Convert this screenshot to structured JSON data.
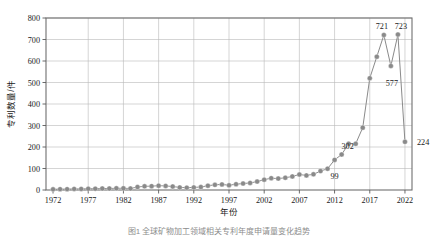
{
  "figure": {
    "caption": "图1  全球矿物加工领域相关专利年度申请量变化趋势"
  },
  "chart_data": {
    "type": "line",
    "title": "",
    "xlabel": "年份",
    "ylabel": "专利数量/件",
    "xlim": [
      1971,
      2023
    ],
    "ylim": [
      0,
      800
    ],
    "ytick_labels": [
      "0",
      "100",
      "200",
      "300",
      "400",
      "500",
      "600",
      "700",
      "800"
    ],
    "yticks": [
      0,
      100,
      200,
      300,
      400,
      500,
      600,
      700,
      800
    ],
    "xtick_labels": [
      "1972",
      "1977",
      "1982",
      "1987",
      "1992",
      "1997",
      "2002",
      "2007",
      "2012",
      "2017",
      "2022"
    ],
    "xticks": [
      1972,
      1977,
      1982,
      1987,
      1992,
      1997,
      2002,
      2007,
      2012,
      2017,
      2022
    ],
    "grid": true,
    "legend": "none",
    "marker": "circle",
    "series_color": "#8a8a8a",
    "line_color": "#8a8a8a",
    "x": [
      1972,
      1973,
      1974,
      1975,
      1976,
      1977,
      1978,
      1979,
      1980,
      1981,
      1982,
      1983,
      1984,
      1985,
      1986,
      1987,
      1988,
      1989,
      1990,
      1991,
      1992,
      1993,
      1994,
      1995,
      1996,
      1997,
      1998,
      1999,
      2000,
      2001,
      2002,
      2003,
      2004,
      2005,
      2006,
      2007,
      2008,
      2009,
      2010,
      2011,
      2012,
      2013,
      2014,
      2015,
      2016,
      2017,
      2018,
      2019,
      2020,
      2021,
      2022
    ],
    "values": [
      3,
      4,
      4,
      5,
      5,
      6,
      6,
      7,
      7,
      8,
      8,
      7,
      14,
      17,
      18,
      20,
      19,
      16,
      12,
      11,
      12,
      14,
      20,
      24,
      26,
      22,
      27,
      30,
      33,
      39,
      48,
      55,
      53,
      57,
      63,
      72,
      68,
      73,
      88,
      99,
      140,
      165,
      215,
      215,
      290,
      520,
      620,
      721,
      577,
      723,
      224
    ],
    "annotations": [
      {
        "label": "99",
        "x": 2011,
        "y": 99
      },
      {
        "label": "302",
        "x": 2013,
        "y": 165
      },
      {
        "label": "577",
        "x": 2020,
        "y": 577
      },
      {
        "label": "721",
        "x": 2019,
        "y": 721
      },
      {
        "label": "723",
        "x": 2021,
        "y": 723
      },
      {
        "label": "224",
        "x": 2022,
        "y": 224
      }
    ]
  }
}
